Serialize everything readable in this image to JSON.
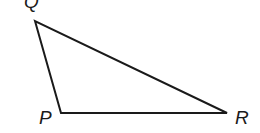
{
  "diagram": {
    "type": "triangle",
    "vertices": [
      {
        "name": "Q",
        "x": 35,
        "y": 21
      },
      {
        "name": "P",
        "x": 61,
        "y": 113
      },
      {
        "name": "R",
        "x": 227,
        "y": 113
      }
    ],
    "labels": {
      "Q": "Q",
      "P": "P",
      "R": "R"
    },
    "stroke_color": "#1a1a1a"
  }
}
